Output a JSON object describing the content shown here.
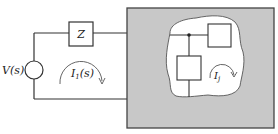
{
  "diagram": {
    "type": "circuit",
    "colors": {
      "wire": "#333333",
      "box_fill": "#c8c8c8",
      "box_stroke": "#444444",
      "blob_fill": "#ffffff",
      "background": "#ffffff"
    },
    "source": {
      "label": "V(s)"
    },
    "impedance": {
      "label": "Z"
    },
    "loop_current_outer": {
      "label": "I",
      "subscript": "1",
      "suffix": "(s)"
    },
    "loop_current_inner": {
      "label": "I",
      "subscript": "j"
    }
  }
}
